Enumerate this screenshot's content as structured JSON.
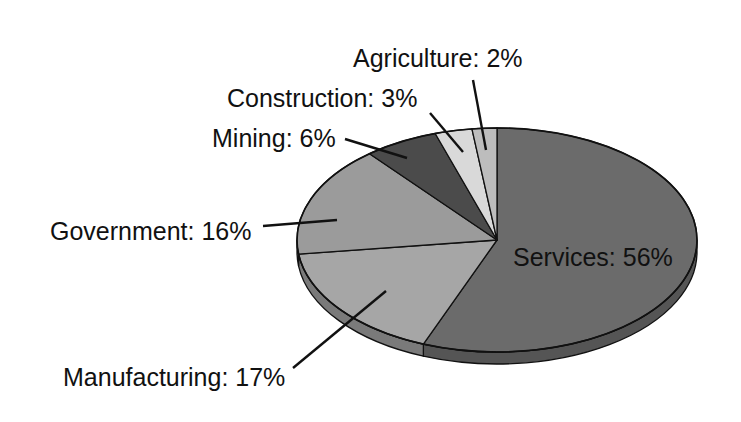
{
  "chart_data": {
    "type": "pie",
    "style": "3d-tilted",
    "title": "",
    "start_angle_deg": 0,
    "direction": "clockwise",
    "slices": [
      {
        "key": "services",
        "label": "Services",
        "value": 56,
        "display": "Services: 56%",
        "color": "#6b6b6b",
        "side_color": "#555555"
      },
      {
        "key": "manufacturing",
        "label": "Manufacturing",
        "value": 17,
        "display": "Manufacturing: 17%",
        "color": "#a6a6a6",
        "side_color": "#7a7a7a"
      },
      {
        "key": "government",
        "label": "Government",
        "value": 16,
        "display": "Government: 16%",
        "color": "#9b9b9b",
        "side_color": "#6e6e6e"
      },
      {
        "key": "mining",
        "label": "Mining",
        "value": 6,
        "display": "Mining: 6%",
        "color": "#4b4b4b",
        "side_color": "#333333"
      },
      {
        "key": "construction",
        "label": "Construction",
        "value": 3,
        "display": "Construction: 3%",
        "color": "#d9d9d9",
        "side_color": "#aaaaaa"
      },
      {
        "key": "agriculture",
        "label": "Agriculture",
        "value": 2,
        "display": "Agriculture: 2%",
        "color": "#bdbdbd",
        "side_color": "#909090"
      }
    ],
    "legend": "none (direct labels with leader lines)",
    "units": "%"
  },
  "labels": {
    "services": "Services: 56%",
    "manufacturing": "Manufacturing: 17%",
    "government": "Government: 16%",
    "mining": "Mining: 6%",
    "construction": "Construction: 3%",
    "agriculture": "Agriculture: 2%"
  }
}
